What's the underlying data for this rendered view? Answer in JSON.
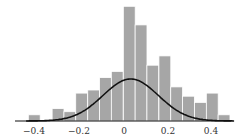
{
  "chart_data": {
    "type": "bar",
    "subtype": "histogram_with_normal_fit",
    "title": "",
    "xlabel": "",
    "ylabel": "",
    "xlim": [
      -0.46,
      0.5
    ],
    "bin_width": 0.0533,
    "bins_left_edges": [
      -0.43,
      -0.377,
      -0.323,
      -0.27,
      -0.217,
      -0.163,
      -0.11,
      -0.057,
      -0.003,
      0.05,
      0.103,
      0.157,
      0.21,
      0.263,
      0.317,
      0.37,
      0.423
    ],
    "counts": [
      1,
      0,
      2,
      1.5,
      4.5,
      5,
      7,
      8,
      18.5,
      15.5,
      9,
      10.5,
      5.5,
      4,
      3,
      4.5,
      1
    ],
    "curve": {
      "type": "normal",
      "mean": 0.03,
      "peak_relative": 0.78
    },
    "x_ticks": [
      "-0.4",
      "-0.2",
      "0",
      "0.2",
      "0.4"
    ],
    "x_tick_values": [
      -0.4,
      -0.2,
      0,
      0.2,
      0.4
    ],
    "grid": false,
    "legend": null,
    "colors": {
      "bar": "#a6a6a6",
      "bar_edge": "#ffffff",
      "curve": "#111111",
      "axis": "#111111"
    }
  },
  "axis": {
    "ticks": [
      "−0.4",
      "−0.2",
      "0",
      "0.2",
      "0.4"
    ]
  }
}
